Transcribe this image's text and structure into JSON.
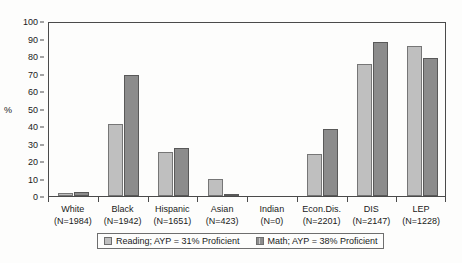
{
  "chart_data": {
    "type": "bar",
    "title": "",
    "subtitle": "",
    "xlabel": "",
    "ylabel": "%",
    "ylim": [
      0,
      100
    ],
    "yticks": [
      0,
      10,
      20,
      30,
      40,
      50,
      60,
      70,
      80,
      90,
      100
    ],
    "grid": false,
    "legend_position": "bottom",
    "categories": [
      "White",
      "Black",
      "Hispanic",
      "Asian",
      "Indian",
      "Econ.Dis.",
      "DIS",
      "LEP"
    ],
    "category_counts": [
      "(N=1984)",
      "(N=1942)",
      "(N=1651)",
      "(N=423)",
      "(N=0)",
      "(N=2201)",
      "(N=2147)",
      "(N=1228)"
    ],
    "series": [
      {
        "name": "Reading; AYP = 31% Proficient",
        "color": "#bfbfbf",
        "values": [
          1.5,
          41,
          25,
          10,
          0,
          24,
          75.5,
          85.5
        ]
      },
      {
        "name": "Math; AYP = 38% Proficient",
        "color": "#8c8c8c",
        "values": [
          2.5,
          69,
          27.5,
          0.5,
          0,
          38.5,
          88,
          79
        ]
      }
    ]
  },
  "axis": {
    "y_title": "%"
  },
  "legend": {
    "entries": [
      {
        "label": "Reading; AYP = 31% Proficient",
        "swatch": "reading-swatch"
      },
      {
        "label": "Math; AYP = 38% Proficient",
        "swatch": "math-swatch"
      }
    ]
  },
  "colors": {
    "series_reading": "#bfbfbf",
    "series_math": "#8c8c8c",
    "axis": "#4a4a4a",
    "background": "#fdfdfc",
    "text": "#1a1a1a"
  }
}
